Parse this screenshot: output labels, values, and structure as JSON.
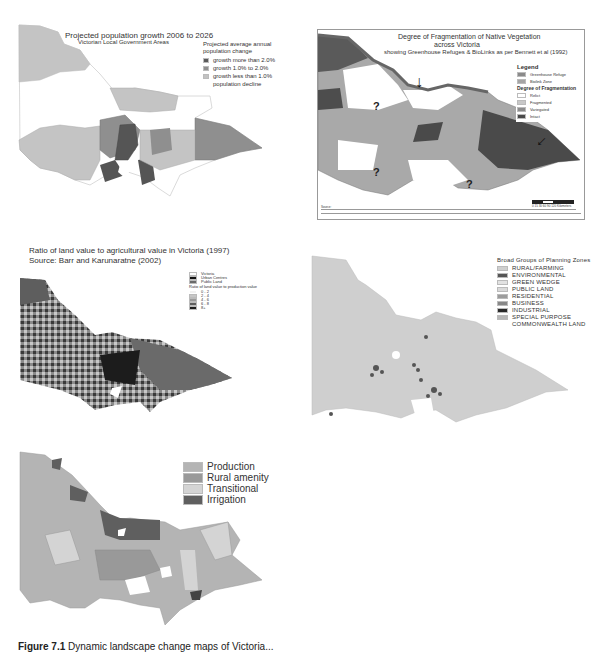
{
  "figure": {
    "caption_label": "Figure 7.1",
    "caption_text": "Dynamic landscape change maps of Victoria..."
  },
  "panels": [
    {
      "id": "population-growth",
      "title": "Projected population growth 2006 to 2026",
      "subtitle": "Victorian Local Government Areas",
      "legend_title": "Projected average annual population change",
      "legend": [
        {
          "label": "growth more than 2.0%",
          "color": "#5a5a5a"
        },
        {
          "label": "growth 1.0% to 2.0%",
          "color": "#8f8f8f"
        },
        {
          "label": "growth less than 1.0%",
          "color": "#c2c2c2"
        },
        {
          "label": "population decline",
          "color": "#ffffff"
        }
      ]
    },
    {
      "id": "vegetation-fragmentation",
      "title": "Degree of Fragmentation of Native Vegetation",
      "title_line2": "across Victoria",
      "subtitle": "showing Greenhouse Refuges & BioLinks as per Bennett et al (1992)",
      "legend_heading": "Legend",
      "legend_top": [
        {
          "label": "Greenhouse Refuge",
          "color": "#8a8a8a"
        },
        {
          "label": "Biolink Zone",
          "color": "#a5a5a5"
        }
      ],
      "legend_sub_heading": "Degree of Fragmentation",
      "legend": [
        {
          "label": "Relict",
          "color": "#ffffff"
        },
        {
          "label": "Fragmented",
          "color": "#c8c8c8"
        },
        {
          "label": "Variegated",
          "color": "#8c8c8c"
        },
        {
          "label": "Intact",
          "color": "#4a4a4a"
        }
      ],
      "annotations": [
        "?",
        "?",
        "?"
      ],
      "scale_bar": "0 15 30 60 90 120 Kilometers",
      "source_label": "Source:"
    },
    {
      "id": "land-value-ratio",
      "title": "Ratio of land value to agricultural value in Victoria (1997)",
      "subtitle": "Source: Barr and Karunaratne (2002)",
      "legend_top": [
        {
          "label": "Victoria",
          "color": "#ffffff"
        },
        {
          "label": "Urban Centres",
          "color": "#111111"
        },
        {
          "label": "Public Land",
          "color": "#6a6a6a"
        }
      ],
      "legend_title": "Ratio of land value to production value",
      "legend": [
        {
          "label": "0 - 2",
          "color": "#f2f2f2"
        },
        {
          "label": "2 - 4",
          "color": "#c6c6c6"
        },
        {
          "label": "4 - 6",
          "color": "#9a9a9a"
        },
        {
          "label": "6 - 8",
          "color": "#5e5e5e"
        },
        {
          "label": "8+",
          "color": "#1c1c1c"
        }
      ]
    },
    {
      "id": "planning-zones",
      "legend_title": "Broad Groups of Planning Zones",
      "legend": [
        {
          "label": "RURAL/FARMING",
          "color": "#cfcfcf"
        },
        {
          "label": "ENVIRONMENTAL",
          "color": "#555555"
        },
        {
          "label": "GREEN WEDGE",
          "color": "#e2e2e2"
        },
        {
          "label": "PUBLIC LAND",
          "color": "#dadada"
        },
        {
          "label": "RESIDENTIAL",
          "color": "#9c9c9c"
        },
        {
          "label": "BUSINESS",
          "color": "#888888"
        },
        {
          "label": "INDUSTRIAL",
          "color": "#2a2a2a"
        },
        {
          "label": "SPECIAL PURPOSE",
          "color": "#b8b8b8"
        },
        {
          "label": "COMMONWEALTH LAND",
          "color": null
        }
      ]
    },
    {
      "id": "rural-land-types",
      "legend": [
        {
          "label": "Production",
          "color": "#b4b4b4"
        },
        {
          "label": "Rural amenity",
          "color": "#999999"
        },
        {
          "label": "Transitional",
          "color": "#d4d4d4"
        },
        {
          "label": "Irrigation",
          "color": "#5f5f5f"
        }
      ]
    }
  ]
}
